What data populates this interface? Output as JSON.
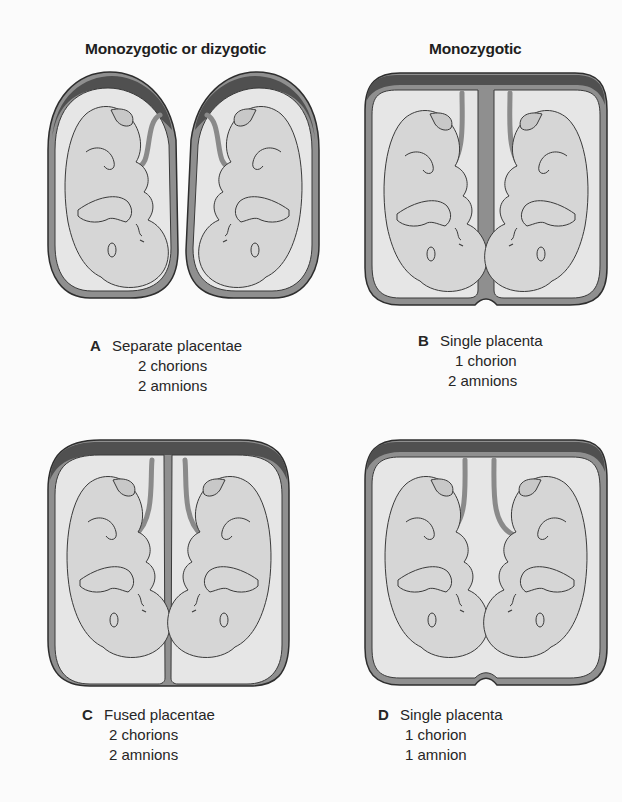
{
  "headings": {
    "left": "Monozygotic or dizygotic",
    "right": "Monozygotic"
  },
  "panels": [
    {
      "letter": "A",
      "title": "Separate placentae",
      "chorions": "2 chorions",
      "amnions": "2 amnions"
    },
    {
      "letter": "B",
      "title": "Single placenta",
      "chorions": "1 chorion",
      "amnions": "2 amnions"
    },
    {
      "letter": "C",
      "title": "Fused placentae",
      "chorions": "2 chorions",
      "amnions": "2 amnions"
    },
    {
      "letter": "D",
      "title": "Single placenta",
      "chorions": "1 chorion",
      "amnions": "1 amnion"
    }
  ],
  "colors": {
    "placenta": "#555555",
    "chorion": "#8f8f8f",
    "amnion_fill": "#e8e8e8",
    "fetus": "#d6d6d6",
    "outline": "#3a3a3a"
  }
}
